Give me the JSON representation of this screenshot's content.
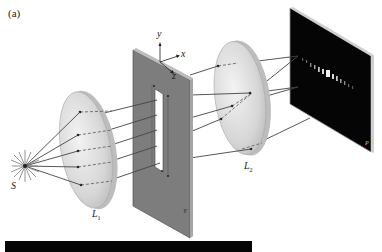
{
  "figure": {
    "panel_label": "(a)",
    "source_label": "S",
    "lens1_label": "L",
    "lens1_sub": "1",
    "lens2_label": "L",
    "lens2_sub": "2",
    "axes": {
      "y": "y",
      "x": "x",
      "z": "z"
    },
    "slit_plate_label": "Y",
    "screen_label": "P"
  },
  "colors": {
    "background": "#ffffff",
    "lens_fill": "#d9d9d9",
    "lens_edge": "#b5b5b5",
    "plate_fill": "#7d7d7d",
    "plate_edge": "#5a5a5a",
    "screen_fill": "#050505",
    "ray": "#444444",
    "fringe": "#f2f2f2",
    "bar": "#050505"
  }
}
